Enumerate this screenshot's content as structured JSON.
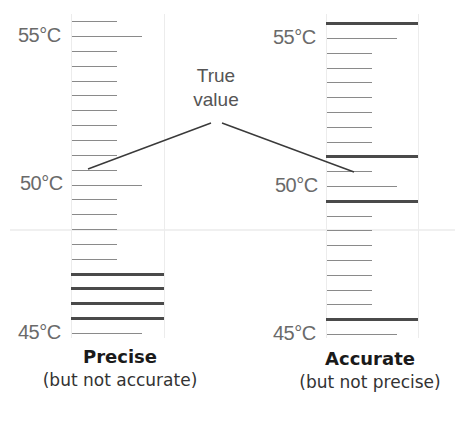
{
  "callout": {
    "line1": "True",
    "line2": "value"
  },
  "left": {
    "title": "Precise",
    "subtitle": "(but not accurate)",
    "labels": {
      "top": "55°C",
      "mid": "50°C",
      "bottom": "45°C"
    },
    "readings_c": [
      47.0,
      46.5,
      46.0,
      45.5
    ]
  },
  "right": {
    "title": "Accurate",
    "subtitle": "(but not precise)",
    "labels": {
      "top": "55°C",
      "mid": "50°C",
      "bottom": "45°C"
    },
    "readings_c": [
      55.5,
      51.0,
      49.5,
      45.5
    ]
  },
  "true_value_c": 50.5,
  "colors": {
    "tick": "#8a8a8a",
    "reading": "#4a4a4a",
    "label": "#6a6a6a"
  }
}
